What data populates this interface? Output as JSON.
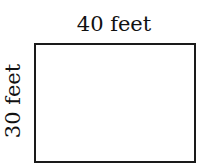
{
  "diagram": {
    "shape": "rectangle",
    "width_label": "40 feet",
    "height_label": "30 feet",
    "stroke_color": "#1a1a1a",
    "fill_color": "#ffffff"
  }
}
